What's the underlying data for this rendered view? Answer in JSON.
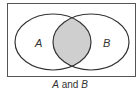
{
  "diagram": {
    "type": "venn",
    "sets": [
      {
        "label": "A"
      },
      {
        "label": "B"
      }
    ],
    "shaded_region": "A ∩ B",
    "caption": {
      "left": "A",
      "middle": " and ",
      "right": "B"
    },
    "colors": {
      "shade": "#cfcfcf",
      "stroke": "#333333",
      "frame": "#555555"
    }
  }
}
